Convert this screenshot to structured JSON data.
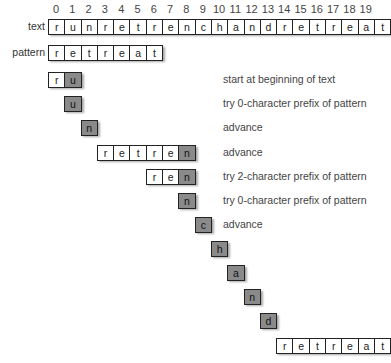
{
  "indices": [
    "0",
    "1",
    "2",
    "3",
    "4",
    "5",
    "6",
    "7",
    "8",
    "9",
    "10",
    "11",
    "12",
    "13",
    "14",
    "15",
    "16",
    "17",
    "18",
    "19"
  ],
  "labels": {
    "text": "text",
    "pattern": "pattern"
  },
  "text_chars": [
    "r",
    "u",
    "n",
    "r",
    "e",
    "t",
    "r",
    "e",
    "n",
    "c",
    "h",
    "a",
    "n",
    "d",
    "r",
    "e",
    "t",
    "r",
    "e",
    "a"
  ],
  "text_last": "t",
  "pattern_chars": [
    "r",
    "e",
    "t",
    "r",
    "e",
    "a",
    "t"
  ],
  "steps": [
    {
      "start": 0,
      "top": 72,
      "cells": [
        {
          "c": "r",
          "hl": false
        },
        {
          "c": "u",
          "hl": true
        }
      ],
      "note": "start at beginning of text"
    },
    {
      "start": 1,
      "top": 96,
      "cells": [
        {
          "c": "u",
          "hl": true
        }
      ],
      "note": "try 0-character prefix of pattern"
    },
    {
      "start": 2,
      "top": 120,
      "cells": [
        {
          "c": "n",
          "hl": true
        }
      ],
      "note": "advance"
    },
    {
      "start": 3,
      "top": 145,
      "cells": [
        {
          "c": "r",
          "hl": false
        },
        {
          "c": "e",
          "hl": false
        },
        {
          "c": "t",
          "hl": false
        },
        {
          "c": "r",
          "hl": false
        },
        {
          "c": "e",
          "hl": false
        },
        {
          "c": "n",
          "hl": true
        }
      ],
      "note": "advance"
    },
    {
      "start": 6,
      "top": 169,
      "cells": [
        {
          "c": "r",
          "hl": false
        },
        {
          "c": "e",
          "hl": false
        },
        {
          "c": "n",
          "hl": true
        }
      ],
      "note": "try 2-character prefix of pattern"
    },
    {
      "start": 8,
      "top": 193,
      "cells": [
        {
          "c": "n",
          "hl": true
        }
      ],
      "note": "try 0-character prefix of pattern"
    },
    {
      "start": 9,
      "top": 217,
      "cells": [
        {
          "c": "c",
          "hl": true
        }
      ],
      "note": "advance"
    },
    {
      "start": 10,
      "top": 241,
      "cells": [
        {
          "c": "h",
          "hl": true
        }
      ],
      "note": ""
    },
    {
      "start": 11,
      "top": 265,
      "cells": [
        {
          "c": "a",
          "hl": true
        }
      ],
      "note": ""
    },
    {
      "start": 12,
      "top": 289,
      "cells": [
        {
          "c": "n",
          "hl": true
        }
      ],
      "note": ""
    },
    {
      "start": 13,
      "top": 313,
      "cells": [
        {
          "c": "d",
          "hl": true
        }
      ],
      "note": ""
    },
    {
      "start": 14,
      "top": 338,
      "cells": [
        {
          "c": "r",
          "hl": false
        },
        {
          "c": "e",
          "hl": false
        },
        {
          "c": "t",
          "hl": false
        },
        {
          "c": "r",
          "hl": false
        },
        {
          "c": "e",
          "hl": false
        },
        {
          "c": "a",
          "hl": false
        },
        {
          "c": "t",
          "hl": false
        }
      ],
      "note": ""
    }
  ]
}
